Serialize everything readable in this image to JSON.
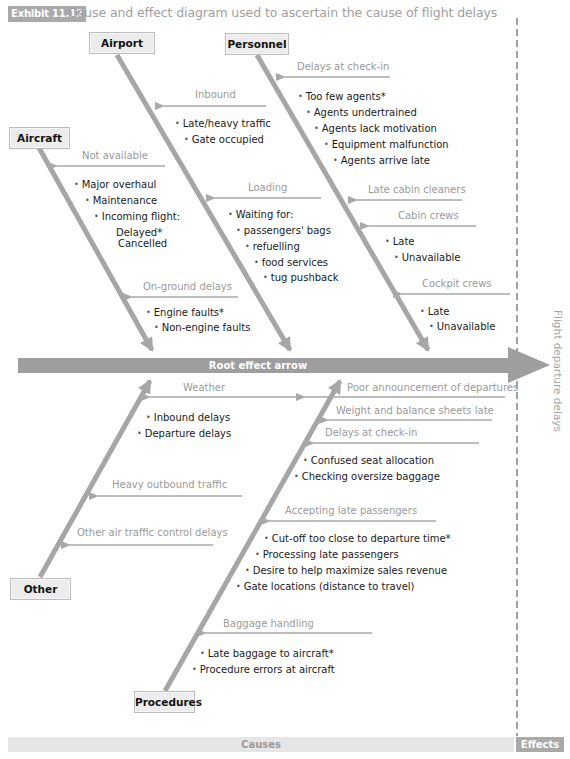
{
  "title": {
    "badge": "Exhibit 11.12",
    "text": "Cause and effect diagram used to ascertain the cause of flight delays"
  },
  "colors": {
    "bone": "#a6a6a6",
    "spine": "#9e9e9e",
    "sub_arrow": "#a8a8a8",
    "label_grey": "#9a9a9a",
    "badge": "#a9a9a9",
    "box_fill": "#ececec",
    "text": "#1a1a1a"
  },
  "spine": {
    "label": "Root effect arrow"
  },
  "effect": {
    "label": "Flight departure delays"
  },
  "footer": {
    "causes": "Causes",
    "effects": "Effects"
  },
  "categories": {
    "airport": {
      "label": "Airport",
      "subcauses": [
        {
          "label": "Inbound",
          "items": [
            "Late/heavy traffic",
            "Gate occupied"
          ]
        },
        {
          "label": "Loading",
          "items": [
            "Waiting for:",
            "passengers' bags",
            "refuelling",
            "food services",
            "tug pushback"
          ]
        }
      ]
    },
    "personnel": {
      "label": "Personnel",
      "subcauses": [
        {
          "label": "Delays at check-in",
          "items": [
            "Too few agents*",
            "Agents undertrained",
            "Agents lack motivation",
            "Equipment malfunction",
            "Agents arrive late"
          ]
        },
        {
          "label": "Late cabin cleaners",
          "items": []
        },
        {
          "label": "Cabin crews",
          "items": [
            "Late",
            "Unavailable"
          ]
        },
        {
          "label": "Cockpit crews",
          "items": [
            "Late",
            "Unavailable"
          ]
        }
      ]
    },
    "aircraft": {
      "label": "Aircraft",
      "subcauses": [
        {
          "label": "Not available",
          "items": [
            "Major overhaul",
            "Maintenance",
            "Incoming flight:",
            "Delayed*",
            "Cancelled"
          ]
        },
        {
          "label": "On-ground delays",
          "items": [
            "Engine faults*",
            "Non-engine faults"
          ]
        }
      ]
    },
    "other": {
      "label": "Other",
      "subcauses": [
        {
          "label": "Weather",
          "items": [
            "Inbound delays",
            "Departure delays"
          ]
        },
        {
          "label": "Heavy outbound traffic",
          "items": []
        },
        {
          "label": "Other air traffic control delays",
          "items": []
        }
      ]
    },
    "procedures": {
      "label": "Procedures",
      "subcauses": [
        {
          "label": "Poor announcement of departures",
          "items": []
        },
        {
          "label": "Weight and balance sheets late",
          "items": []
        },
        {
          "label": "Delays at check-in",
          "items": [
            "Confused seat allocation",
            "Checking oversize baggage"
          ]
        },
        {
          "label": "Accepting late passengers",
          "items": [
            "Cut-off too close to departure time*",
            "Processing late passengers",
            "Desire to help maximize sales revenue",
            "Gate locations (distance to travel)"
          ]
        },
        {
          "label": "Baggage handling",
          "items": [
            "Late baggage to aircraft*",
            "Procedure errors at aircraft"
          ]
        }
      ]
    }
  }
}
